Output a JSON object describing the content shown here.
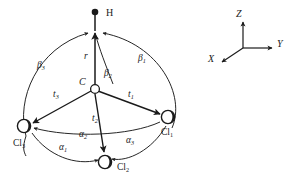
{
  "figure": {
    "type": "molecular-geometry-diagram",
    "molecule": "CHCl3",
    "atoms": [
      {
        "id": "H",
        "label": "H",
        "subscript": "",
        "style": "filled-dot",
        "x": 95,
        "y": 12
      },
      {
        "id": "C",
        "label": "C",
        "subscript": "",
        "style": "open-circle",
        "x": 95,
        "y": 89
      },
      {
        "id": "Cl1",
        "label": "Cl",
        "subscript": "1",
        "style": "shaded-circle",
        "x": 168,
        "y": 117
      },
      {
        "id": "Cl2",
        "label": "Cl",
        "subscript": "2",
        "style": "shaded-circle",
        "x": 105,
        "y": 162
      },
      {
        "id": "Cl3",
        "label": "Cl",
        "subscript": "3",
        "style": "shaded-circle",
        "x": 24,
        "y": 126
      }
    ],
    "bond_labels": [
      {
        "id": "r",
        "label": "r",
        "subscript": "",
        "x": 84,
        "y": 55,
        "meaning": "C-H bond length"
      },
      {
        "id": "t1",
        "label": "t",
        "subscript": "1",
        "x": 131,
        "y": 94,
        "meaning": "C-Cl1 bond length"
      },
      {
        "id": "t2",
        "label": "t",
        "subscript": "2",
        "x": 96,
        "y": 118,
        "meaning": "C-Cl2 bond length"
      },
      {
        "id": "t3",
        "label": "t",
        "subscript": "3",
        "x": 57,
        "y": 94,
        "meaning": "C-Cl3 bond length"
      }
    ],
    "angle_labels": [
      {
        "id": "alpha1",
        "label": "α",
        "subscript": "1",
        "x": 64,
        "y": 146,
        "meaning": "Cl3-C-Cl2 angle"
      },
      {
        "id": "alpha2",
        "label": "α",
        "subscript": "2",
        "x": 84,
        "y": 133,
        "meaning": "Cl3-C-Cl1 angle"
      },
      {
        "id": "alpha3",
        "label": "α",
        "subscript": "3",
        "x": 131,
        "y": 139,
        "meaning": "Cl2-C-Cl1 angle"
      },
      {
        "id": "beta1",
        "label": "β",
        "subscript": "1",
        "x": 143,
        "y": 57,
        "meaning": "H-C-Cl1 angle"
      },
      {
        "id": "beta2",
        "label": "β",
        "subscript": "2",
        "x": 108,
        "y": 72,
        "meaning": "H-C-Cl2 angle"
      },
      {
        "id": "beta3",
        "label": "β",
        "subscript": "3",
        "x": 42,
        "y": 64,
        "meaning": "H-C-Cl3 angle"
      }
    ],
    "axes": {
      "origin": {
        "x": 243,
        "y": 48
      },
      "items": [
        {
          "id": "Z",
          "label": "Z",
          "x": 239,
          "y": 13,
          "direction": "up"
        },
        {
          "id": "Y",
          "label": "Y",
          "x": 281,
          "y": 43,
          "direction": "right"
        },
        {
          "id": "X",
          "label": "X",
          "x": 213,
          "y": 58,
          "direction": "down-left"
        }
      ]
    },
    "colors": {
      "ink": "#1a1a1a",
      "background": "#ffffff",
      "arc": "#2a2a2a"
    }
  }
}
